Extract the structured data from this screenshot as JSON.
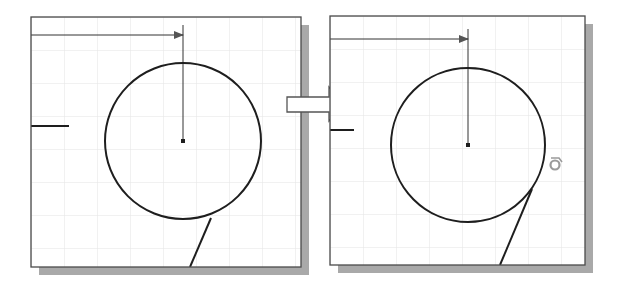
{
  "figure": {
    "colors": {
      "background": "#ffffff",
      "frame": "#4a4a4a",
      "shadow": "#a9a9a9",
      "grid": "#e3e3e3",
      "geometry": "#1e1e1e",
      "arrow_fill": "#ffffff",
      "arrow_stroke": "#555555",
      "tangent_icon": "#9a9a9a"
    }
  },
  "panels": [
    {
      "id": "before",
      "label": "Before",
      "frame": {
        "x": 31,
        "y": 17,
        "w": 270,
        "h": 250
      },
      "circle": {
        "cx": 183,
        "cy": 141,
        "r": 78
      },
      "center_mark": {
        "x": 183,
        "y": 141
      },
      "dimension": {
        "x1": 31,
        "y1": 35,
        "x2": 183,
        "y2": 35,
        "ext_top": 25
      },
      "stub_line": {
        "x1": 31,
        "y1": 126,
        "x2": 69,
        "y2": 126
      },
      "line": {
        "x1": 211,
        "y1": 218,
        "x2": 190,
        "y2": 267
      }
    },
    {
      "id": "after",
      "label": "After",
      "frame": {
        "x": 330,
        "y": 16,
        "w": 255,
        "h": 249
      },
      "circle": {
        "cx": 468,
        "cy": 145,
        "r": 77
      },
      "center_mark": {
        "x": 468,
        "y": 145
      },
      "dimension": {
        "x1": 330,
        "y1": 39,
        "x2": 468,
        "y2": 39,
        "ext_top": 29
      },
      "stub_line": {
        "x1": 330,
        "y1": 130,
        "x2": 354,
        "y2": 130
      },
      "line": {
        "x1": 532,
        "y1": 189,
        "x2": 500,
        "y2": 265
      },
      "tangent_icon": {
        "x": 554,
        "y": 163,
        "name": "tangent-constraint-icon"
      }
    }
  ],
  "transition_arrow": {
    "label": "Transition arrow",
    "direction": "right"
  }
}
